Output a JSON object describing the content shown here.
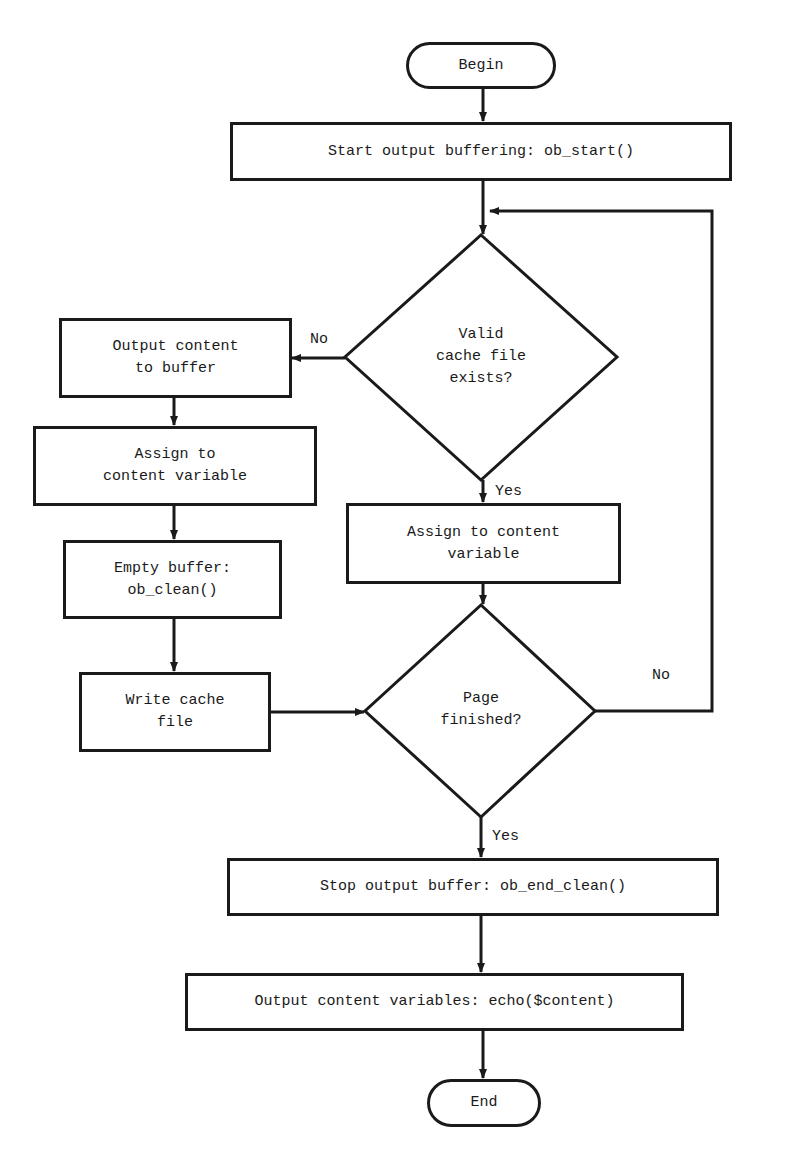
{
  "diagram": {
    "type": "flowchart",
    "title_cutoff": "",
    "nodes": {
      "begin": "Begin",
      "start_buffering": "Start output buffering: ob_start()",
      "decision_cache": "Valid\ncache file\nexists?",
      "output_to_buffer": "Output content\nto buffer",
      "assign_left": "Assign to\ncontent variable",
      "empty_buffer": "Empty buffer:\nob_clean()",
      "write_cache": "Write cache\nfile",
      "assign_right": "Assign to content\nvariable",
      "decision_page": "Page\nfinished?",
      "stop_buffer": "Stop output buffer: ob_end_clean()",
      "output_vars": "Output content variables: echo($content)",
      "end": "End"
    },
    "edge_labels": {
      "cache_no": "No",
      "cache_yes": "Yes",
      "page_no": "No",
      "page_yes": "Yes"
    },
    "edges": [
      {
        "from": "begin",
        "to": "start_buffering"
      },
      {
        "from": "start_buffering",
        "to": "decision_cache"
      },
      {
        "from": "decision_cache",
        "to": "output_to_buffer",
        "label": "No"
      },
      {
        "from": "decision_cache",
        "to": "assign_right",
        "label": "Yes"
      },
      {
        "from": "output_to_buffer",
        "to": "assign_left"
      },
      {
        "from": "assign_left",
        "to": "empty_buffer"
      },
      {
        "from": "empty_buffer",
        "to": "write_cache"
      },
      {
        "from": "write_cache",
        "to": "decision_page"
      },
      {
        "from": "assign_right",
        "to": "decision_page"
      },
      {
        "from": "decision_page",
        "to": "decision_cache",
        "label": "No"
      },
      {
        "from": "decision_page",
        "to": "stop_buffer",
        "label": "Yes"
      },
      {
        "from": "stop_buffer",
        "to": "output_vars"
      },
      {
        "from": "output_vars",
        "to": "end"
      }
    ],
    "colors": {
      "stroke": "#1a1a1a",
      "background": "#ffffff"
    }
  }
}
